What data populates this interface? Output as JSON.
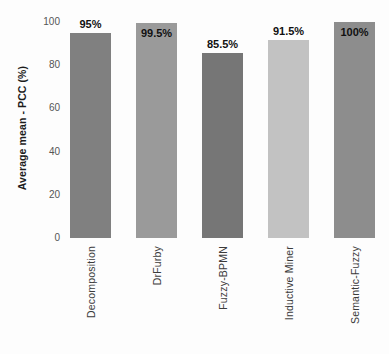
{
  "chart_data": {
    "type": "bar",
    "title": "",
    "subtitle": "",
    "xlabel": "",
    "ylabel": "Average mean - PCC (%)",
    "ylim": [
      0,
      100
    ],
    "yticks": [
      "0",
      "20",
      "40",
      "60",
      "80",
      "100"
    ],
    "grid": false,
    "legend": "none",
    "categories": [
      "Decomposition",
      "DrFurby",
      "Fuzzy-BPMN",
      "Inductive Miner",
      "Semantic-Fuzzy"
    ],
    "values": [
      95,
      99.5,
      85.5,
      91.5,
      100
    ],
    "value_labels": [
      "95%",
      "99.5%",
      "85.5%",
      "91.5%",
      "100%"
    ],
    "label_positions": [
      "outside",
      "inside",
      "outside",
      "outside",
      "inside"
    ],
    "bar_colors": [
      "#808080",
      "#9a9a9a",
      "#767676",
      "#c2c2c2",
      "#8d8d8d"
    ]
  },
  "colors": {
    "background": "#fdfdfd",
    "axis_text": "#555555",
    "category_text": "#3b3b3b",
    "value_text": "#111111"
  }
}
